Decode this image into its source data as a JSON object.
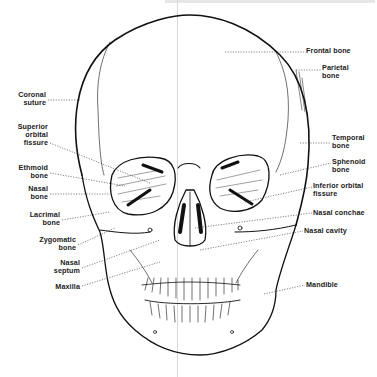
{
  "figure": {
    "ink_color": "#111111",
    "leader_color": "#333333",
    "labels": [
      {
        "id": "frontal-bone",
        "text": "Frontal bone",
        "side": "right",
        "x": 306,
        "y": 47,
        "lx1": 225,
        "ly1": 52,
        "lx2": 305,
        "ly2": 52
      },
      {
        "id": "parietal-bone",
        "text": "Parietal\nbone",
        "side": "right",
        "x": 322,
        "y": 64,
        "lx1": 296,
        "ly1": 70,
        "lx2": 321,
        "ly2": 70
      },
      {
        "id": "coronal-suture",
        "text": "Coronal\nsuture",
        "side": "left",
        "x": 4,
        "y": 91,
        "lx1": 48,
        "ly1": 100,
        "lx2": 80,
        "ly2": 100
      },
      {
        "id": "superior-orbital-fissure",
        "text": "Superior\norbital\nfissure",
        "side": "left",
        "x": 4,
        "y": 123,
        "lx1": 50,
        "ly1": 143,
        "lx2": 150,
        "ly2": 183
      },
      {
        "id": "ethmoid-bone",
        "text": "Ethmoid\nbone",
        "side": "left",
        "x": 4,
        "y": 164,
        "lx1": 50,
        "ly1": 173,
        "lx2": 125,
        "ly2": 186
      },
      {
        "id": "nasal-bone",
        "text": "Nasal\nbone",
        "side": "left",
        "x": 4,
        "y": 185,
        "lx1": 50,
        "ly1": 194,
        "lx2": 110,
        "ly2": 194
      },
      {
        "id": "lacrimal-bone",
        "text": "Lacrimal\nbone",
        "side": "left",
        "x": 4,
        "y": 211,
        "lx1": 62,
        "ly1": 220,
        "lx2": 110,
        "ly2": 212
      },
      {
        "id": "zygomatic-bone",
        "text": "Zygomatic\nbone",
        "side": "left",
        "x": 4,
        "y": 236,
        "lx1": 78,
        "ly1": 245,
        "lx2": 115,
        "ly2": 228
      },
      {
        "id": "nasal-septum",
        "text": "Nasal\nseptum",
        "side": "left",
        "x": 4,
        "y": 259,
        "lx1": 82,
        "ly1": 268,
        "lx2": 160,
        "ly2": 240
      },
      {
        "id": "maxilla",
        "text": "Maxilla",
        "side": "left",
        "x": 4,
        "y": 283,
        "lx1": 82,
        "ly1": 286,
        "lx2": 160,
        "ly2": 262
      },
      {
        "id": "temporal-bone",
        "text": "Temporal\nbone",
        "side": "right",
        "x": 332,
        "y": 134,
        "lx1": 300,
        "ly1": 143,
        "lx2": 331,
        "ly2": 143
      },
      {
        "id": "sphenoid-bone",
        "text": "Sphenoid\nbone",
        "side": "right",
        "x": 332,
        "y": 158,
        "lx1": 280,
        "ly1": 175,
        "lx2": 331,
        "ly2": 163
      },
      {
        "id": "inferior-orbital-fissure",
        "text": "Inferior orbital\nfissure",
        "side": "right",
        "x": 313,
        "y": 182,
        "lx1": 245,
        "ly1": 202,
        "lx2": 312,
        "ly2": 187
      },
      {
        "id": "nasal-conchae",
        "text": "Nasal conchae",
        "side": "right",
        "x": 313,
        "y": 209,
        "lx1": 195,
        "ly1": 228,
        "lx2": 312,
        "ly2": 213
      },
      {
        "id": "nasal-cavity",
        "text": "Nasal cavity",
        "side": "right",
        "x": 304,
        "y": 227,
        "lx1": 200,
        "ly1": 250,
        "lx2": 303,
        "ly2": 231
      },
      {
        "id": "mandible",
        "text": "Mandible",
        "side": "right",
        "x": 306,
        "y": 281,
        "lx1": 264,
        "ly1": 294,
        "lx2": 305,
        "ly2": 285
      }
    ]
  }
}
